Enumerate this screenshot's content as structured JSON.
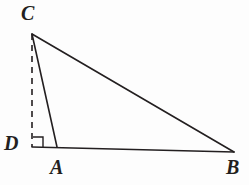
{
  "figure": {
    "kind": "geometry-diagram",
    "background_color": "#fdfdfd",
    "stroke_color": "#231f20",
    "label_color": "#231f20",
    "watermark_text": "",
    "width": 249,
    "height": 185
  },
  "labels": {
    "c": "C",
    "d": "D",
    "a": "A",
    "b": "B"
  },
  "points": {
    "C": {
      "x": 32,
      "y": 34
    },
    "D": {
      "x": 32,
      "y": 147
    },
    "A": {
      "x": 57,
      "y": 147
    },
    "B": {
      "x": 234,
      "y": 152
    }
  },
  "segments": [
    {
      "name": "CB",
      "from": "C",
      "to": "B",
      "style": "solid",
      "width": 1.6
    },
    {
      "name": "CA",
      "from": "C",
      "to": "A",
      "style": "solid",
      "width": 1.6
    },
    {
      "name": "DB",
      "from": "D",
      "to": "B",
      "style": "solid",
      "width": 1.6
    },
    {
      "name": "CD",
      "from": "C",
      "to": "D",
      "style": "dashed",
      "width": 1.6
    }
  ],
  "right_angle_marker": {
    "at": "D",
    "x": 33,
    "y": 136,
    "size": 10
  }
}
